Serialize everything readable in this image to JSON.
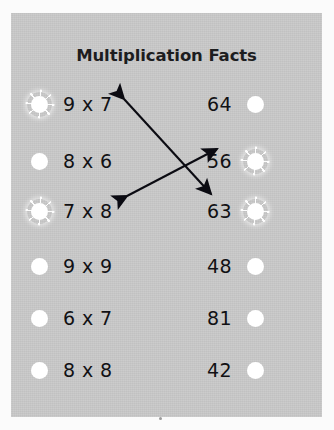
{
  "title": "Multiplication Facts",
  "colors": {
    "panel_background": "#c8c8c8",
    "page_background": "#fbfbfb",
    "text": "#111114",
    "title_text": "#1d1d1f",
    "bubble": "#ffffff",
    "arrow": "#0b0b12"
  },
  "rows": [
    {
      "left": {
        "label": "9 x 7",
        "bubble": "selected"
      },
      "right": {
        "label": "64",
        "bubble": "normal"
      }
    },
    {
      "left": {
        "label": "8 x 6",
        "bubble": "normal"
      },
      "right": {
        "label": "56",
        "bubble": "selected"
      }
    },
    {
      "left": {
        "label": "7 x 8",
        "bubble": "selected"
      },
      "right": {
        "label": "63",
        "bubble": "selected"
      }
    },
    {
      "left": {
        "label": "9 x 9",
        "bubble": "normal"
      },
      "right": {
        "label": "48",
        "bubble": "normal"
      }
    },
    {
      "left": {
        "label": "6 x 7",
        "bubble": "normal"
      },
      "right": {
        "label": "81",
        "bubble": "normal"
      }
    },
    {
      "left": {
        "label": "8 x 8",
        "bubble": "normal"
      },
      "right": {
        "label": "42",
        "bubble": "normal"
      }
    }
  ],
  "connections": [
    {
      "from": "9 x 7",
      "to": "63",
      "style": "double-headed-arrow"
    },
    {
      "from": "7 x 8",
      "to": "56",
      "style": "double-headed-arrow"
    }
  ],
  "row_tops": [
    74,
    131,
    181,
    236,
    288,
    340
  ]
}
